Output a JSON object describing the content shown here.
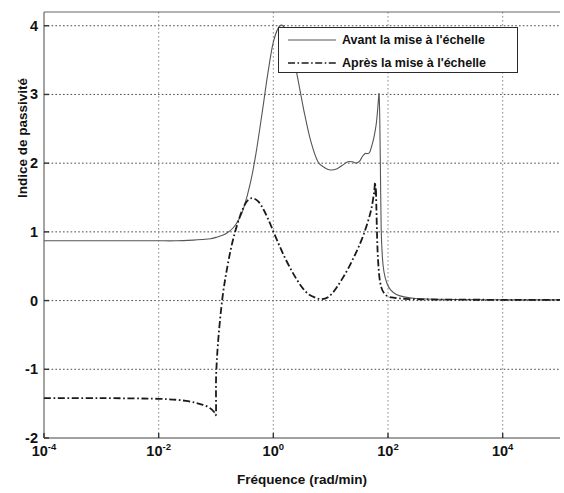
{
  "chart_data": {
    "type": "line",
    "title": "",
    "xlabel": "Fréquence (rad/min)",
    "ylabel": "Indice de passivité",
    "xscale": "log",
    "xlim": [
      0.0001,
      100000
    ],
    "ylim": [
      -2,
      4.2
    ],
    "xticks": [
      "10⁻⁴",
      "10⁻²",
      "10⁰",
      "10²",
      "10⁴"
    ],
    "xtick_values": [
      0.0001,
      0.01,
      1,
      100,
      10000
    ],
    "yticks": [
      "4",
      "3",
      "2",
      "1",
      "0",
      "-1",
      "-2"
    ],
    "ytick_values": [
      4,
      3,
      2,
      1,
      0,
      -1,
      -2
    ],
    "grid": true,
    "legend_position": "top-right",
    "series": [
      {
        "name": "Avant la mise à l'échelle",
        "style": "solid",
        "color": "#555555",
        "x": [
          0.0001,
          0.0004,
          0.002,
          0.006,
          0.01,
          0.02,
          0.04,
          0.06,
          0.08,
          0.1,
          0.13,
          0.16,
          0.2,
          0.25,
          0.3,
          0.4,
          0.5,
          0.65,
          0.8,
          1.0,
          1.3,
          1.7,
          2.2,
          2.8,
          3.5,
          4.5,
          6.0,
          8.0,
          10.0,
          13.0,
          16.0,
          20.0,
          24.0,
          28.0,
          32.0,
          36.0,
          40.0,
          44.0,
          48.0,
          52.0,
          56.0,
          60.0,
          63.0,
          66.0,
          68.0,
          70.0,
          72.0,
          74.0,
          76.0,
          80.0,
          85.0,
          95.0,
          110.0,
          140.0,
          200.0,
          300.0,
          600.0,
          1500.0,
          5000.0,
          20000.0,
          100000.0
        ],
        "y": [
          0.87,
          0.87,
          0.87,
          0.87,
          0.87,
          0.87,
          0.88,
          0.89,
          0.9,
          0.92,
          0.95,
          0.99,
          1.06,
          1.18,
          1.33,
          1.72,
          2.15,
          2.78,
          3.3,
          3.76,
          4.0,
          3.92,
          3.58,
          3.14,
          2.72,
          2.32,
          2.02,
          1.93,
          1.9,
          1.92,
          1.97,
          2.02,
          2.02,
          2.0,
          2.03,
          2.1,
          2.14,
          2.14,
          2.16,
          2.25,
          2.35,
          2.48,
          2.6,
          2.78,
          2.92,
          3.0,
          2.6,
          1.8,
          1.05,
          0.62,
          0.42,
          0.26,
          0.16,
          0.09,
          0.05,
          0.03,
          0.02,
          0.015,
          0.012,
          0.01,
          0.01
        ]
      },
      {
        "name": "Après la mise à l'échelle",
        "style": "dash-dot",
        "color": "#1a1a1a",
        "x": [
          0.0001,
          0.001,
          0.01,
          0.03,
          0.06,
          0.08,
          0.09,
          0.095,
          0.1,
          0.1005,
          0.11,
          0.13,
          0.16,
          0.2,
          0.26,
          0.33,
          0.42,
          0.55,
          0.7,
          0.9,
          1.2,
          1.6,
          2.2,
          3.0,
          4.0,
          5.5,
          7.0,
          9.0,
          11.0,
          13.0,
          16.0,
          20.0,
          25.0,
          30.0,
          36.0,
          42.0,
          48.0,
          52.0,
          56.0,
          58.0,
          59.5,
          60.5,
          61.5,
          62.5,
          64.0,
          66.0,
          70.0,
          76.0,
          85.0,
          100.0,
          130.0,
          200.0,
          400.0,
          1000.0,
          4000.0,
          20000.0,
          100000.0
        ],
        "y": [
          -1.42,
          -1.42,
          -1.43,
          -1.46,
          -1.52,
          -1.57,
          -1.61,
          -1.63,
          -1.63,
          -1.1,
          -0.55,
          0.05,
          0.52,
          0.9,
          1.22,
          1.42,
          1.49,
          1.44,
          1.3,
          1.1,
          0.85,
          0.62,
          0.4,
          0.22,
          0.1,
          0.04,
          0.02,
          0.05,
          0.12,
          0.2,
          0.32,
          0.46,
          0.62,
          0.76,
          0.92,
          1.08,
          1.24,
          1.36,
          1.52,
          1.62,
          1.72,
          1.55,
          1.64,
          1.4,
          1.05,
          0.7,
          0.38,
          0.2,
          0.11,
          0.06,
          0.04,
          0.025,
          0.018,
          0.014,
          0.012,
          0.01,
          0.01
        ]
      }
    ]
  },
  "legend": {
    "items": [
      {
        "label": "Avant la mise à l'échelle",
        "style": "solid"
      },
      {
        "label": "Après la mise à l'échelle",
        "style": "dash-dot"
      }
    ]
  },
  "axes": {
    "xlabel": "Fréquence (rad/min)",
    "ylabel": "Indice de passivité"
  }
}
